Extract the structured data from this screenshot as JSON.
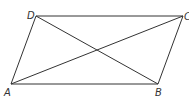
{
  "figure": {
    "type": "parallelogram-with-diagonals",
    "line_color": "#333333",
    "vertices": [
      {
        "label": "A",
        "x": 11,
        "y": 84,
        "lx": 4,
        "ly": 96
      },
      {
        "label": "B",
        "x": 158,
        "y": 84,
        "lx": 155,
        "ly": 96
      },
      {
        "label": "C",
        "x": 183,
        "y": 16,
        "lx": 184,
        "ly": 20
      },
      {
        "label": "D",
        "x": 36,
        "y": 16,
        "lx": 27,
        "ly": 19
      }
    ],
    "sides": [
      [
        "A",
        "B"
      ],
      [
        "B",
        "C"
      ],
      [
        "C",
        "D"
      ],
      [
        "D",
        "A"
      ]
    ],
    "diagonals": [
      [
        "A",
        "C"
      ],
      [
        "B",
        "D"
      ]
    ]
  }
}
